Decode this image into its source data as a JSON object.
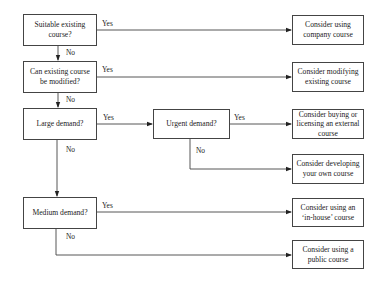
{
  "flowchart": {
    "decisions": [
      {
        "id": "suitable",
        "label": "Suitable existing course?"
      },
      {
        "id": "modified",
        "label": "Can existing course be modified?"
      },
      {
        "id": "large",
        "label": "Large demand?"
      },
      {
        "id": "urgent",
        "label": "Urgent demand?"
      },
      {
        "id": "medium",
        "label": "Medium demand?"
      }
    ],
    "outcomes": [
      {
        "id": "company",
        "label": "Consider using company course"
      },
      {
        "id": "modify",
        "label": "Consider modifying existing course"
      },
      {
        "id": "buy",
        "label": "Consider buying or licensing an external course"
      },
      {
        "id": "develop",
        "label": "Consider developing your own course"
      },
      {
        "id": "inhouse",
        "label": "Consider using an ‘in-house’ course"
      },
      {
        "id": "public",
        "label": "Consider using a public course"
      }
    ],
    "edge_labels": {
      "yes": "Yes",
      "no": "No"
    }
  }
}
